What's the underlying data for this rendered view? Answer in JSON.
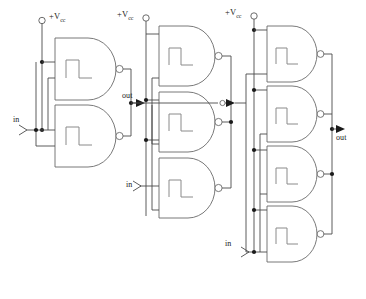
{
  "diagram": {
    "colors": {
      "wire": "#4a4a4a",
      "gate": "#6a6a6a",
      "symbol": "#8a8a8a",
      "dot": "#1a1a1a",
      "background": "#ffffff"
    },
    "labels": {
      "vcc_1": "+V",
      "vcc_1_sub": "cc",
      "vcc_2": "+V",
      "vcc_2_sub": "cc",
      "vcc_3": "+V",
      "vcc_3_sub": "cc",
      "in_1": "in",
      "in_2": "in",
      "in_3": "in",
      "out_1": "out",
      "out_final": "out"
    },
    "stages": [
      {
        "name": "stage-1",
        "gate_count": 2,
        "supply_label": "+Vcc",
        "input_label": "in",
        "output_label": "out"
      },
      {
        "name": "stage-2",
        "gate_count": 3,
        "supply_label": "+Vcc",
        "input_label": "in",
        "output_label": ""
      },
      {
        "name": "stage-3",
        "gate_count": 4,
        "supply_label": "+Vcc",
        "input_label": "in",
        "output_label": "out"
      }
    ],
    "gate_symbol": "schmitt-trigger-hysteresis",
    "gate_type": "nand"
  }
}
